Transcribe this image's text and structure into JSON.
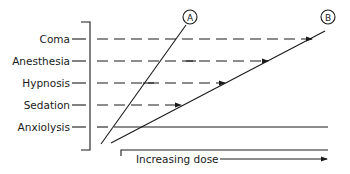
{
  "diagram": {
    "levels": [
      {
        "label": "Coma",
        "y": 39,
        "arrow_end_x": 312
      },
      {
        "label": "Anesthesia",
        "y": 61,
        "arrow_end_x": 268
      },
      {
        "label": "Hypnosis",
        "y": 83,
        "arrow_end_x": 225
      },
      {
        "label": "Sedation",
        "y": 105,
        "arrow_end_x": 181
      },
      {
        "label": "Anxiolysis",
        "y": 127
      }
    ],
    "curves": [
      {
        "id": "A",
        "label": "A"
      },
      {
        "id": "B",
        "label": "B"
      }
    ],
    "x_axis_label": "Increasing dose",
    "color": "#1a1a1a"
  }
}
